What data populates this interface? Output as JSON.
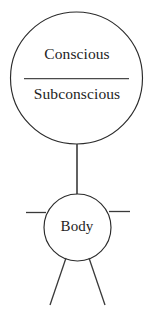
{
  "diagram": {
    "stroke_color": "#2b2b2b",
    "background_color": "#ffffff",
    "mind_circle": {
      "upper_label": "Conscious",
      "lower_label": "Subconscious",
      "divider": "horizontal-rule"
    },
    "body_circle": {
      "label": "Body"
    },
    "connector": {
      "name": "vertical-connector"
    },
    "limbs": {
      "left_arm": "left-arm-line",
      "right_arm": "right-arm-line",
      "left_leg": "left-leg-line",
      "right_leg": "right-leg-line"
    }
  }
}
